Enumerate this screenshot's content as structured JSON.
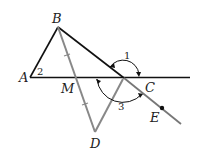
{
  "diagram": {
    "type": "geometry",
    "colors": {
      "black_line": "#111111",
      "gray_line": "#888888",
      "background": "#ffffff"
    },
    "points": {
      "A": {
        "label": "A",
        "x": 30,
        "y": 77
      },
      "B": {
        "label": "B",
        "x": 58,
        "y": 27
      },
      "C": {
        "label": "C",
        "x": 124,
        "y": 78
      },
      "M": {
        "label": "M",
        "x": 76,
        "y": 78
      },
      "D": {
        "label": "D",
        "x": 95,
        "y": 132
      },
      "E": {
        "label": "E",
        "x": 162,
        "y": 108
      }
    },
    "angles": {
      "angle1": {
        "label": "1"
      },
      "angle2": {
        "label": "2"
      },
      "angle3": {
        "label": "3"
      }
    },
    "segments": [
      {
        "name": "AB",
        "color": "black"
      },
      {
        "name": "BE",
        "color": "black/gray",
        "note": "line through B, C, E"
      },
      {
        "name": "AC-line",
        "color": "black",
        "note": "line through A, M, C extended"
      },
      {
        "name": "BD",
        "color": "gray",
        "note": "passes through M, with tick marks BM = MD"
      },
      {
        "name": "DC",
        "color": "gray"
      }
    ]
  }
}
